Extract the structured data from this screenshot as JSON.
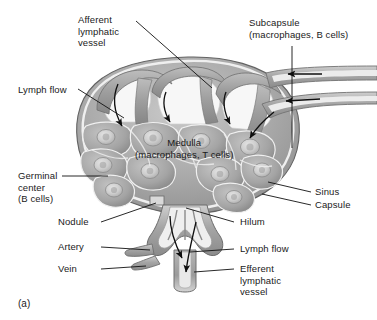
{
  "figure": {
    "caption": "(a)"
  },
  "labels": {
    "afferent": {
      "line1": "Afferent",
      "line2": "lymphatic",
      "line3": "vessel"
    },
    "subcapsule": {
      "line1": "Subcapsule",
      "line2": "(macrophages, B cells)"
    },
    "lymph_flow_left": {
      "line1": "Lymph flow"
    },
    "medulla": {
      "line1": "Medulla",
      "line2": "(macrophages, T cells)"
    },
    "germinal_center": {
      "line1": "Germinal",
      "line2": "center",
      "line3": "(B cells)"
    },
    "sinus": {
      "line1": "Sinus"
    },
    "capsule": {
      "line1": "Capsule"
    },
    "nodule": {
      "line1": "Nodule"
    },
    "hilum": {
      "line1": "Hilum"
    },
    "artery": {
      "line1": "Artery"
    },
    "lymph_flow_right": {
      "line1": "Lymph flow"
    },
    "vein": {
      "line1": "Vein"
    },
    "efferent": {
      "line1": "Efferent",
      "line2": "lymphatic",
      "line3": "vessel"
    }
  },
  "colors": {
    "background": "#ffffff",
    "text": "#1a1a1a",
    "leader_line": "#111111",
    "capsule_outline": "#5a5a5a",
    "tissue_dark": "#8d8d8d",
    "tissue_mid": "#a8a8a8",
    "tissue_light": "#c4c4c4",
    "sinus_space": "#f2f2f2",
    "germinal_center": "#d8d8d8",
    "arrow": "#0f0f0f"
  }
}
